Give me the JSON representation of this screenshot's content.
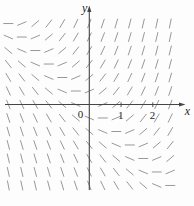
{
  "chart_data": {
    "type": "slope-field",
    "equation": "dy/dx = x + y",
    "x_label": "x",
    "y_label": "y",
    "origin_label": "0",
    "x_ticks": [
      {
        "value": 1,
        "label": "1"
      },
      {
        "value": 2,
        "label": "2"
      }
    ],
    "y_ticks": [],
    "x_range": [
      -2.55,
      2.55
    ],
    "y_range": [
      -2.55,
      2.55
    ],
    "grid_step": 0.425,
    "grid_columns": 13,
    "grid_rows": 13,
    "segment_length_px": 10,
    "axes_arrows": true,
    "grid": "off",
    "legend": "none",
    "colors": {
      "segment": "#97989a",
      "axis": "#454545",
      "text": "#1e1e1e",
      "background": "#fdfdfd"
    },
    "layout": {
      "width": 194,
      "height": 206,
      "origin_px": [
        89.3,
        104.5
      ],
      "unit_px": 31.75,
      "x_axis_start_px": 5,
      "x_axis_arrow_tip_px": 185.5,
      "y_axis_bottom_px": 190,
      "y_axis_arrow_tip_px": 5.5
    }
  }
}
